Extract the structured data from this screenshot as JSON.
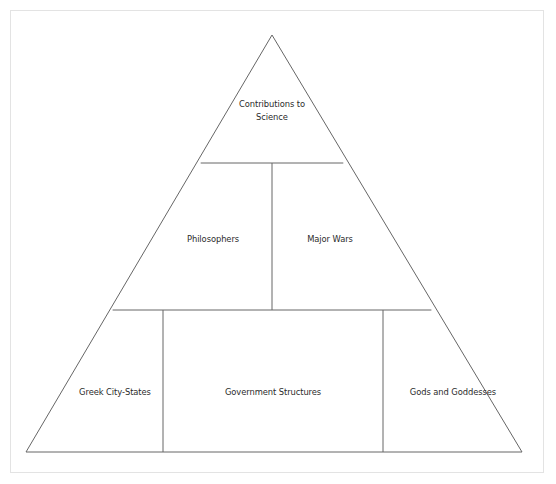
{
  "diagram": {
    "type": "pyramid",
    "shape": "triangle",
    "background_color": "#ffffff",
    "line_color": "#666666",
    "text_color": "#2b2b2b",
    "frame_color": "#e3e3e3",
    "geometry": {
      "apex": [
        272,
        35
      ],
      "bottom_left": [
        26,
        452
      ],
      "bottom_right": [
        522,
        452
      ],
      "tier_divider_y": [
        163,
        310
      ],
      "middle_row_divider_x": [
        272
      ],
      "bottom_row_divider_x": [
        163,
        383
      ]
    },
    "tiers": [
      {
        "level": 1,
        "position": "top",
        "cells": [
          {
            "label": "Contributions to\nScience"
          }
        ]
      },
      {
        "level": 2,
        "position": "middle",
        "cells": [
          {
            "label": "Philosophers"
          },
          {
            "label": "Major Wars"
          }
        ]
      },
      {
        "level": 3,
        "position": "bottom",
        "cells": [
          {
            "label": "Greek City-States"
          },
          {
            "label": "Government Structures"
          },
          {
            "label": "Gods and Goddesses"
          }
        ]
      }
    ]
  }
}
